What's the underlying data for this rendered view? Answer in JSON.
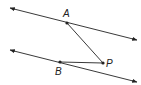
{
  "diagram": {
    "type": "geometry",
    "colors": {
      "stroke": "#222222",
      "background": "#ffffff"
    },
    "lines": [
      {
        "id": "top-line",
        "from": [
          10,
          8
        ],
        "to": [
          137,
          40
        ],
        "arrows": "both"
      },
      {
        "id": "bottom-line",
        "from": [
          10,
          50
        ],
        "to": [
          137,
          82
        ],
        "arrows": "both"
      }
    ],
    "segments": [
      {
        "id": "segment-AP",
        "from": "A",
        "to": "P"
      },
      {
        "id": "segment-BP",
        "from": "B",
        "to": "P"
      }
    ],
    "points": [
      {
        "id": "A",
        "label": "A",
        "x": 67,
        "y": 23,
        "label_x": 63,
        "label_y": 17
      },
      {
        "id": "B",
        "label": "B",
        "x": 60,
        "y": 62,
        "label_x": 55,
        "label_y": 75
      },
      {
        "id": "P",
        "label": "P",
        "x": 103,
        "y": 63,
        "label_x": 106,
        "label_y": 67
      }
    ]
  }
}
